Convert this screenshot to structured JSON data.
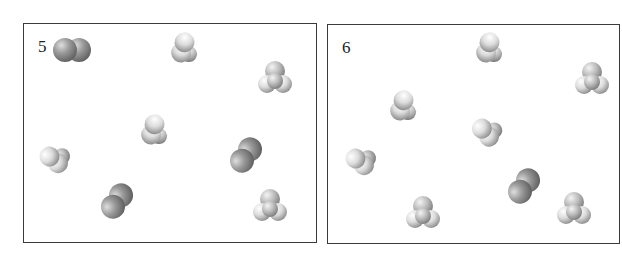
{
  "panels": [
    {
      "label": "5",
      "box": {
        "x": 23,
        "y": 23,
        "w": 294,
        "h": 220
      },
      "label_pos": {
        "x": 14,
        "y": 13
      },
      "molecules": [
        {
          "type": "diatomic",
          "x": 72,
          "y": 50,
          "angle": 0
        },
        {
          "type": "light",
          "x": 185,
          "y": 48,
          "angle": 40
        },
        {
          "type": "pyramid",
          "x": 275,
          "y": 78,
          "angle": 0
        },
        {
          "type": "light",
          "x": 155,
          "y": 130,
          "angle": 40
        },
        {
          "type": "light",
          "x": 55,
          "y": 158,
          "angle": -30
        },
        {
          "type": "diatomic",
          "x": 246,
          "y": 155,
          "angle": -55
        },
        {
          "type": "diatomic",
          "x": 117,
          "y": 201,
          "angle": -55
        },
        {
          "type": "pyramid",
          "x": 270,
          "y": 206,
          "angle": 0
        }
      ]
    },
    {
      "label": "6",
      "box": {
        "x": 327,
        "y": 24,
        "w": 293,
        "h": 220
      },
      "label_pos": {
        "x": 14,
        "y": 13
      },
      "molecules": [
        {
          "type": "light",
          "x": 490,
          "y": 48,
          "angle": 40
        },
        {
          "type": "pyramid",
          "x": 592,
          "y": 79,
          "angle": 0
        },
        {
          "type": "light",
          "x": 404,
          "y": 106,
          "angle": 40
        },
        {
          "type": "light",
          "x": 487,
          "y": 131,
          "angle": -20
        },
        {
          "type": "light",
          "x": 361,
          "y": 160,
          "angle": -30
        },
        {
          "type": "diatomic",
          "x": 524,
          "y": 186,
          "angle": -55
        },
        {
          "type": "pyramid",
          "x": 423,
          "y": 213,
          "angle": 0
        },
        {
          "type": "pyramid",
          "x": 574,
          "y": 209,
          "angle": 0
        }
      ]
    }
  ],
  "colors": {
    "border": "#3a3a3a",
    "dark_atom_light": "#d8d8d8",
    "dark_atom_dark": "#6e6e6e",
    "white_atom_light": "#ffffff",
    "white_atom_dark": "#9a9a9a"
  }
}
